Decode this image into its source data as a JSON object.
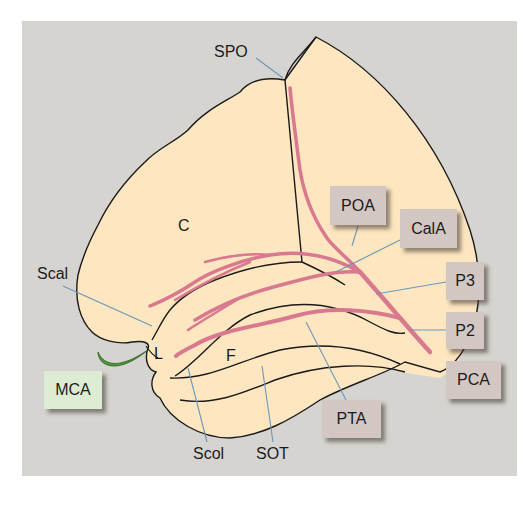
{
  "diagram": {
    "colors": {
      "background": "#d6d4d0",
      "brain_surface": "#fde6c0",
      "outline": "#1a1a1a",
      "artery_pca": "#d8798f",
      "artery_mca": "#4f9a3a",
      "leader_line": "#6b98b8",
      "label_box": "#d3c7c3",
      "label_box_mca": "#dcedd4"
    },
    "region_labels": {
      "cuneus": "C",
      "lingual": "L",
      "fusiform": "F"
    },
    "sulcus_labels": {
      "spo": "SPO",
      "scal": "Scal",
      "scol": "Scol",
      "sot": "SOT"
    },
    "artery_labels": {
      "poa": "POA",
      "cala": "CalA",
      "p3": "P3",
      "p2": "P2",
      "pca": "PCA",
      "pta": "PTA",
      "mca": "MCA"
    }
  }
}
